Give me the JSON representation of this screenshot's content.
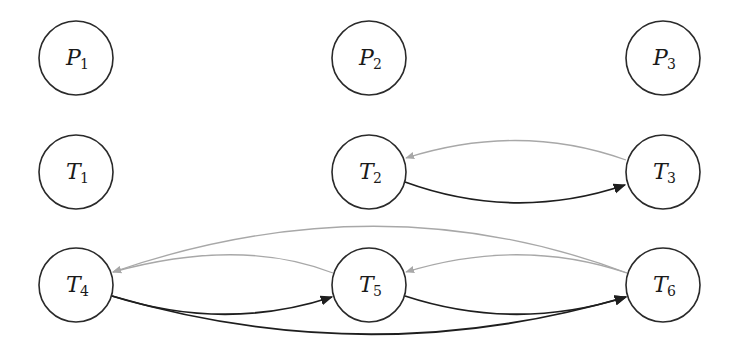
{
  "diagram": {
    "type": "directed-graph",
    "colors": {
      "background": "#ffffff",
      "node_stroke": "#2a2a2a",
      "forward_edge": "#1e1e1e",
      "backward_edge": "#a8a8a8"
    },
    "nodes": [
      {
        "id": "P1",
        "letter": "P",
        "sub": "1",
        "cx": 76,
        "cy": 58,
        "r": 37
      },
      {
        "id": "P2",
        "letter": "P",
        "sub": "2",
        "cx": 369,
        "cy": 58,
        "r": 37
      },
      {
        "id": "P3",
        "letter": "P",
        "sub": "3",
        "cx": 663,
        "cy": 58,
        "r": 37
      },
      {
        "id": "T1",
        "letter": "T",
        "sub": "1",
        "cx": 76,
        "cy": 172,
        "r": 37
      },
      {
        "id": "T2",
        "letter": "T",
        "sub": "2",
        "cx": 369,
        "cy": 172,
        "r": 37
      },
      {
        "id": "T3",
        "letter": "T",
        "sub": "3",
        "cx": 663,
        "cy": 172,
        "r": 37
      },
      {
        "id": "T4",
        "letter": "T",
        "sub": "4",
        "cx": 76,
        "cy": 285,
        "r": 37
      },
      {
        "id": "T5",
        "letter": "T",
        "sub": "5",
        "cx": 369,
        "cy": 285,
        "r": 37
      },
      {
        "id": "T6",
        "letter": "T",
        "sub": "6",
        "cx": 663,
        "cy": 285,
        "r": 37
      }
    ],
    "edges": [
      {
        "from": "T2",
        "to": "T3",
        "style": "forward",
        "d": "M 405 182 Q 515 222 625 185"
      },
      {
        "from": "T3",
        "to": "T2",
        "style": "backward",
        "d": "M 626 160 Q 520 122 406 158"
      },
      {
        "from": "T4",
        "to": "T5",
        "style": "forward",
        "d": "M 112 296 Q 225 332 332 297"
      },
      {
        "from": "T4",
        "to": "T6",
        "style": "forward",
        "d": "M 112 296 Q 370 372 626 297"
      },
      {
        "from": "T5",
        "to": "T6",
        "style": "forward",
        "d": "M 405 296 Q 515 332 626 297"
      },
      {
        "from": "T5",
        "to": "T4",
        "style": "backward",
        "d": "M 333 273 Q 240 237 113 272"
      },
      {
        "from": "T6",
        "to": "T5",
        "style": "backward",
        "d": "M 627 273 Q 520 237 406 272"
      },
      {
        "from": "T6",
        "to": "T4",
        "style": "backward",
        "d": "M 627 273 Q 380 180 113 272"
      }
    ]
  }
}
